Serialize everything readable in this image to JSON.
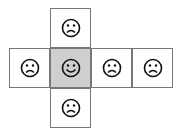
{
  "diagram": {
    "type": "cube-net",
    "colors": {
      "border": "#777777",
      "fill": "#ffffff",
      "shaded_fill": "#cfcfcf",
      "icon_stroke": "#111111"
    },
    "faces": [
      {
        "id": "top",
        "icon": "frown-face-icon",
        "shaded": false
      },
      {
        "id": "left",
        "icon": "frown-face-icon",
        "shaded": false
      },
      {
        "id": "center",
        "icon": "smile-face-icon",
        "shaded": true
      },
      {
        "id": "right",
        "icon": "frown-face-icon",
        "shaded": false
      },
      {
        "id": "far-right",
        "icon": "frown-face-icon",
        "shaded": false
      },
      {
        "id": "bottom",
        "icon": "frown-face-icon",
        "shaded": false
      }
    ]
  }
}
